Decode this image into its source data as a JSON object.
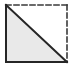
{
  "canvas": {
    "width": 76,
    "height": 68,
    "background_color": "#ffffff"
  },
  "figure": {
    "name": "right-triangle-in-square",
    "square": {
      "left": 6,
      "top": 5,
      "right": 67,
      "bottom": 62
    },
    "edges": {
      "left": {
        "name": "left-edge",
        "style": "solid",
        "color": "#262626",
        "width": 2
      },
      "bottom": {
        "name": "bottom-edge",
        "style": "solid",
        "color": "#262626",
        "width": 2
      },
      "top": {
        "name": "top-edge",
        "style": "dashed",
        "color": "#3a3a3a",
        "width": 1.6,
        "dash_pattern": "5 3"
      },
      "right": {
        "name": "right-edge",
        "style": "dashed",
        "color": "#3a3a3a",
        "width": 1.6,
        "dash_pattern": "5 3"
      }
    },
    "diagonal": {
      "name": "hypotenuse",
      "style": "solid",
      "color": "#262626",
      "width": 2,
      "from": "top-left",
      "to": "bottom-right"
    },
    "shaded_region": {
      "name": "lower-left-triangle",
      "fill_color": "#e9e9e9",
      "vertices": "top-left, bottom-left, bottom-right"
    },
    "unshaded_region": {
      "name": "upper-right-triangle",
      "fill_color": "#ffffff",
      "vertices": "top-left, top-right, bottom-right"
    }
  },
  "chart_data": {
    "type": "diagram",
    "title": "",
    "shapes": [
      {
        "kind": "polygon",
        "label": "shaded right triangle",
        "points": [
          [
            6,
            5
          ],
          [
            6,
            62
          ],
          [
            67,
            62
          ]
        ],
        "fill": "#e9e9e9",
        "stroke": "none"
      },
      {
        "kind": "line",
        "label": "left side (solid)",
        "points": [
          [
            6,
            5
          ],
          [
            6,
            62
          ]
        ],
        "stroke": "#262626",
        "dash": false
      },
      {
        "kind": "line",
        "label": "bottom side (solid)",
        "points": [
          [
            6,
            62
          ],
          [
            67,
            62
          ]
        ],
        "stroke": "#262626",
        "dash": false
      },
      {
        "kind": "line",
        "label": "top side (dashed)",
        "points": [
          [
            6,
            5
          ],
          [
            67,
            5
          ]
        ],
        "stroke": "#3a3a3a",
        "dash": true
      },
      {
        "kind": "line",
        "label": "right side (dashed)",
        "points": [
          [
            67,
            5
          ],
          [
            67,
            62
          ]
        ],
        "stroke": "#3a3a3a",
        "dash": true
      },
      {
        "kind": "line",
        "label": "diagonal (solid)",
        "points": [
          [
            6,
            5
          ],
          [
            67,
            62
          ]
        ],
        "stroke": "#262626",
        "dash": false
      }
    ]
  }
}
